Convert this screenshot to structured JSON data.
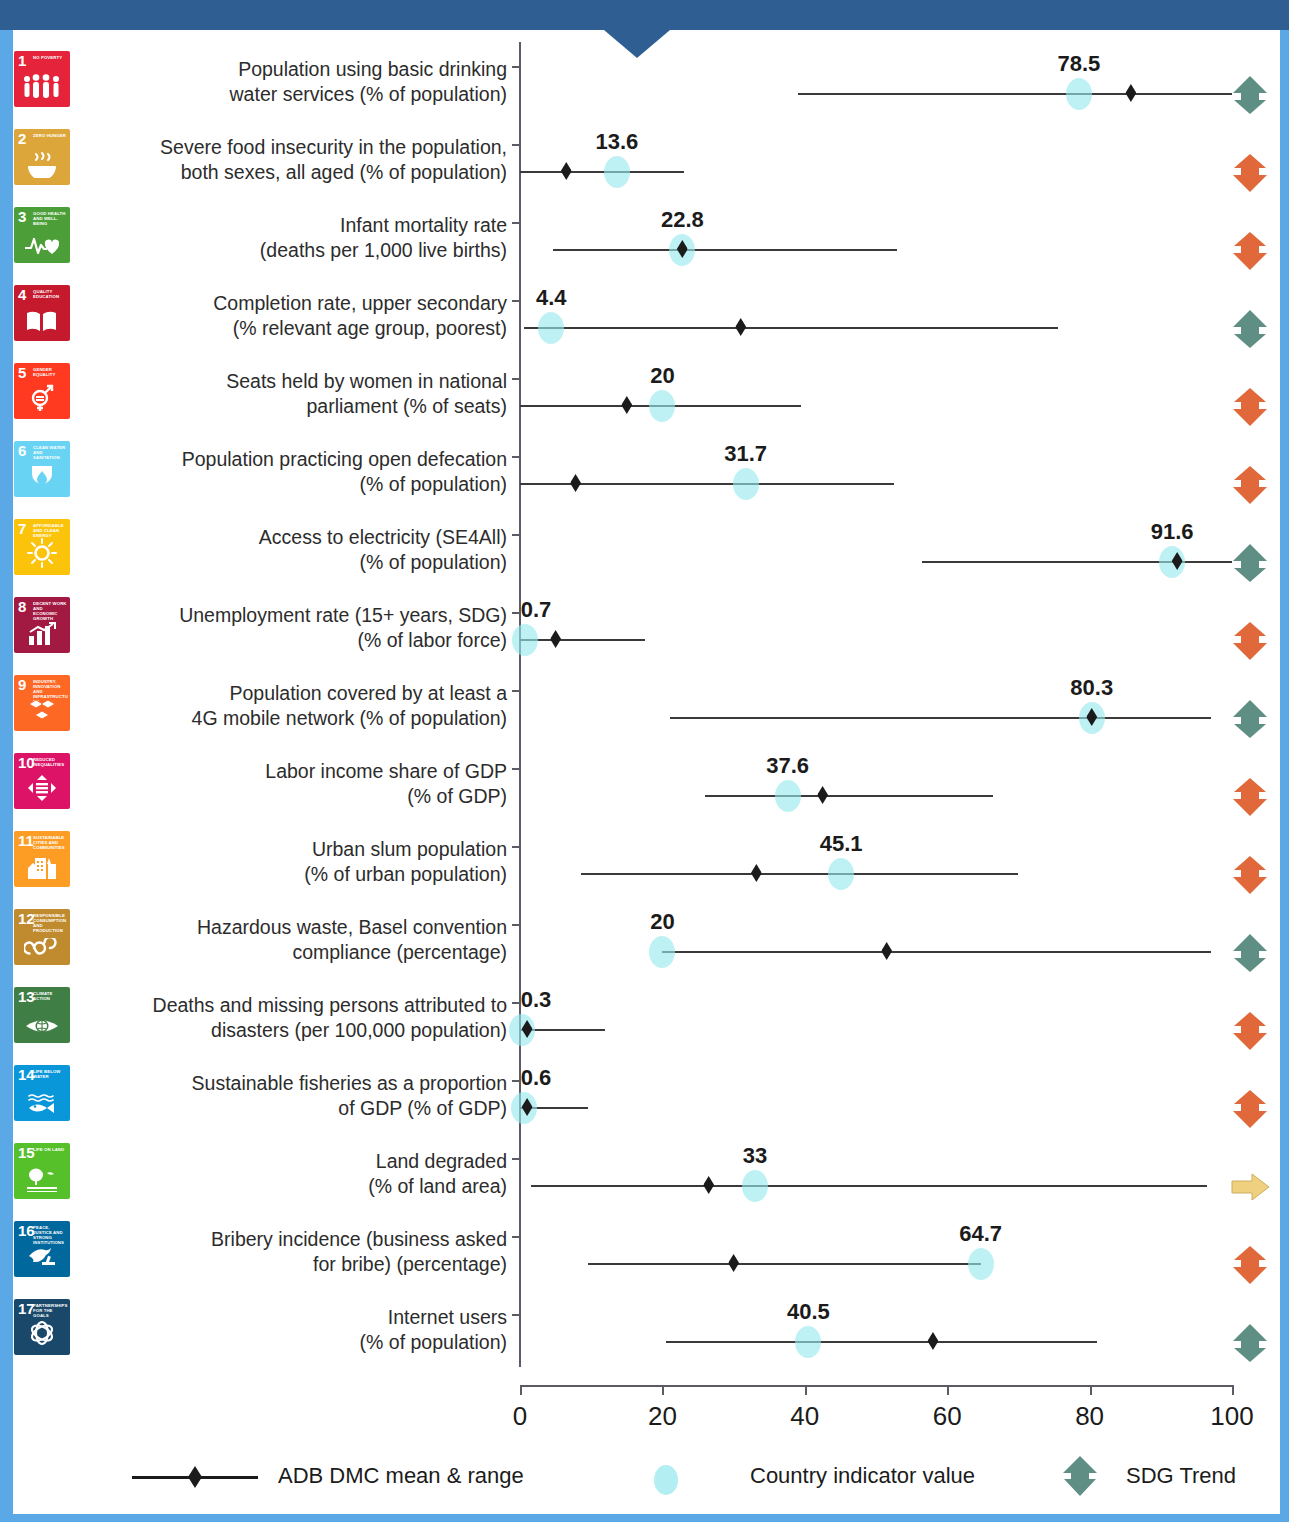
{
  "colors": {
    "frame_top": "#2f5f92",
    "frame_side": "#5aa9e6",
    "mean_marker": "#1b1b1b",
    "country_bubble": "#96e8ee",
    "trend_up": "#5e8e84",
    "trend_down": "#e0683a",
    "trend_flat": "#efd07e"
  },
  "axis": {
    "min": 0,
    "max": 100,
    "ticks": [
      "0",
      "20",
      "40",
      "60",
      "80",
      "100"
    ]
  },
  "legend": {
    "mean_range": "ADB DMC mean & range",
    "country_value": "Country indicator value",
    "sdg_trend": "SDG Trend"
  },
  "chart_data": {
    "type": "scatter",
    "title": "",
    "xlabel": "",
    "ylabel": "",
    "xlim": [
      0,
      100
    ],
    "xticks": [
      0,
      20,
      40,
      60,
      80,
      100
    ],
    "grid": false,
    "legend_position": "bottom",
    "rows": [
      {
        "goal": 1,
        "goal_tag": "NO POVERTY",
        "icon_color": "#e5243b",
        "icon_glyph": "family-icon",
        "label": "Population using basic drinking water services (% of population)",
        "label_lines": [
          "Population using basic drinking",
          "water services (% of population)"
        ],
        "range_min": 39.0,
        "range_max": 100.0,
        "mean": 85.8,
        "country_value": 78.5,
        "country_value_label": "78.5",
        "trend": "up"
      },
      {
        "goal": 2,
        "goal_tag": "ZERO HUNGER",
        "icon_color": "#dda63a",
        "icon_glyph": "bowl-icon",
        "label": "Severe food insecurity in the population, both sexes, all aged (% of population)",
        "label_lines": [
          "Severe food insecurity in the population,",
          "both sexes, all aged (% of population)"
        ],
        "range_min": 0.0,
        "range_max": 23.0,
        "mean": 6.5,
        "country_value": 13.6,
        "country_value_label": "13.6",
        "trend": "down"
      },
      {
        "goal": 3,
        "goal_tag": "GOOD HEALTH AND WELL-BEING",
        "icon_color": "#4c9f38",
        "icon_glyph": "heartbeat-icon",
        "label": "Infant mortality rate (deaths per 1,000 live births)",
        "label_lines": [
          "Infant mortality rate",
          "(deaths per 1,000 live births)"
        ],
        "range_min": 4.6,
        "range_max": 53.0,
        "mean": 22.8,
        "country_value": 22.8,
        "country_value_label": "22.8",
        "trend": "down"
      },
      {
        "goal": 4,
        "goal_tag": "QUALITY EDUCATION",
        "icon_color": "#c5192d",
        "icon_glyph": "book-icon",
        "label": "Completion rate, upper secondary (% relevant age group, poorest)",
        "label_lines": [
          "Completion rate, upper secondary",
          "(% relevant age group, poorest)"
        ],
        "range_min": 0.6,
        "range_max": 75.5,
        "mean": 31.0,
        "country_value": 4.4,
        "country_value_label": "4.4",
        "trend": "up"
      },
      {
        "goal": 5,
        "goal_tag": "GENDER EQUALITY",
        "icon_color": "#ff3a21",
        "icon_glyph": "gender-icon",
        "label": "Seats held by women in national parliament (% of seats)",
        "label_lines": [
          "Seats held by women in national",
          "parliament (% of seats)"
        ],
        "range_min": 0.0,
        "range_max": 39.5,
        "mean": 15.0,
        "country_value": 20.0,
        "country_value_label": "20",
        "trend": "down"
      },
      {
        "goal": 6,
        "goal_tag": "CLEAN WATER AND SANITATION",
        "icon_color": "#68d3f2",
        "icon_glyph": "water-drop-icon",
        "label": "Population practicing open defecation (% of population)",
        "label_lines": [
          "Population practicing open defecation",
          "(% of population)"
        ],
        "range_min": 0.0,
        "range_max": 52.5,
        "mean": 7.8,
        "country_value": 31.7,
        "country_value_label": "31.7",
        "trend": "down"
      },
      {
        "goal": 7,
        "goal_tag": "AFFORDABLE AND CLEAN ENERGY",
        "icon_color": "#fcc30b",
        "icon_glyph": "sun-icon",
        "label": "Access to electricity (SE4All) (% of population)",
        "label_lines": [
          "Access to electricity (SE4All)",
          "(% of population)"
        ],
        "range_min": 56.5,
        "range_max": 100.0,
        "mean": 92.3,
        "country_value": 91.6,
        "country_value_label": "91.6",
        "trend": "up"
      },
      {
        "goal": 8,
        "goal_tag": "DECENT WORK AND ECONOMIC GROWTH",
        "icon_color": "#a21942",
        "icon_glyph": "bar-growth-icon",
        "label": "Unemployment rate (15+ years, SDG) (% of labor force)",
        "label_lines": [
          "Unemployment rate (15+ years, SDG)",
          "(% of labor force)"
        ],
        "range_min": 0.0,
        "range_max": 17.5,
        "mean": 5.0,
        "country_value": 0.7,
        "country_value_label": "0.7",
        "trend": "down"
      },
      {
        "goal": 9,
        "goal_tag": "INDUSTRY, INNOVATION AND INFRASTRUCTURE",
        "icon_color": "#fd6925",
        "icon_glyph": "cubes-icon",
        "label": "Population covered by at least a 4G mobile network (% of population)",
        "label_lines": [
          "Population covered by at least a",
          "4G mobile network (% of population)"
        ],
        "range_min": 21.0,
        "range_max": 97.0,
        "mean": 80.3,
        "country_value": 80.3,
        "country_value_label": "80.3",
        "trend": "up"
      },
      {
        "goal": 10,
        "goal_tag": "REDUCED INEQUALITIES",
        "icon_color": "#dd1367",
        "icon_glyph": "equal-arrows-icon",
        "label": "Labor income share of GDP (% of GDP)",
        "label_lines": [
          "Labor income share of GDP",
          "(% of GDP)"
        ],
        "range_min": 26.0,
        "range_max": 66.5,
        "mean": 42.5,
        "country_value": 37.6,
        "country_value_label": "37.6",
        "trend": "down"
      },
      {
        "goal": 11,
        "goal_tag": "SUSTAINABLE CITIES AND COMMUNITIES",
        "icon_color": "#fd9d24",
        "icon_glyph": "city-icon",
        "label": "Urban slum population (% of urban population)",
        "label_lines": [
          "Urban slum population",
          "(% of urban population)"
        ],
        "range_min": 8.5,
        "range_max": 70.0,
        "mean": 33.2,
        "country_value": 45.1,
        "country_value_label": "45.1",
        "trend": "down"
      },
      {
        "goal": 12,
        "goal_tag": "RESPONSIBLE CONSUMPTION AND PRODUCTION",
        "icon_color": "#bf8b2e",
        "icon_glyph": "infinity-icon",
        "label": "Hazardous waste, Basel convention compliance (percentage)",
        "label_lines": [
          "Hazardous waste, Basel convention",
          "compliance (percentage)"
        ],
        "range_min": 20.0,
        "range_max": 97.0,
        "mean": 51.5,
        "country_value": 20.0,
        "country_value_label": "20",
        "trend": "up"
      },
      {
        "goal": 13,
        "goal_tag": "CLIMATE ACTION",
        "icon_color": "#3f7e44",
        "icon_glyph": "eye-globe-icon",
        "label": "Deaths and missing persons attributed to disasters (per 100,000 population)",
        "label_lines": [
          "Deaths and missing persons attributed to",
          "disasters (per 100,000 population)"
        ],
        "range_min": 0.0,
        "range_max": 12.0,
        "mean": 1.0,
        "country_value": 0.3,
        "country_value_label": "0.3",
        "trend": "down"
      },
      {
        "goal": 14,
        "goal_tag": "LIFE BELOW WATER",
        "icon_color": "#0a97d9",
        "icon_glyph": "fish-icon",
        "label": "Sustainable fisheries as a proportion of GDP (% of GDP)",
        "label_lines": [
          "Sustainable fisheries as a proportion",
          "of GDP (% of GDP)"
        ],
        "range_min": 0.0,
        "range_max": 9.5,
        "mean": 1.0,
        "country_value": 0.6,
        "country_value_label": "0.6",
        "trend": "down"
      },
      {
        "goal": 15,
        "goal_tag": "LIFE ON LAND",
        "icon_color": "#56c02b",
        "icon_glyph": "tree-icon",
        "label": "Land degraded (% of land area)",
        "label_lines": [
          "Land degraded",
          "(% of land area)"
        ],
        "range_min": 1.5,
        "range_max": 96.5,
        "mean": 26.5,
        "country_value": 33.0,
        "country_value_label": "33",
        "trend": "flat"
      },
      {
        "goal": 16,
        "goal_tag": "PEACE, JUSTICE AND STRONG INSTITUTIONS",
        "icon_color": "#00689d",
        "icon_glyph": "dove-gavel-icon",
        "label": "Bribery incidence (business asked for bribe) (percentage)",
        "label_lines": [
          "Bribery incidence (business asked",
          "for bribe)  (percentage)"
        ],
        "range_min": 9.5,
        "range_max": 64.7,
        "mean": 30.0,
        "country_value": 64.7,
        "country_value_label": "64.7",
        "trend": "down"
      },
      {
        "goal": 17,
        "goal_tag": "PARTNERSHIPS FOR THE GOALS",
        "icon_color": "#19486a",
        "icon_glyph": "circle-rings-icon",
        "label": "Internet users (% of population)",
        "label_lines": [
          "Internet users",
          "(% of population)"
        ],
        "range_min": 20.5,
        "range_max": 81.0,
        "mean": 58.0,
        "country_value": 40.5,
        "country_value_label": "40.5",
        "trend": "up"
      }
    ]
  }
}
